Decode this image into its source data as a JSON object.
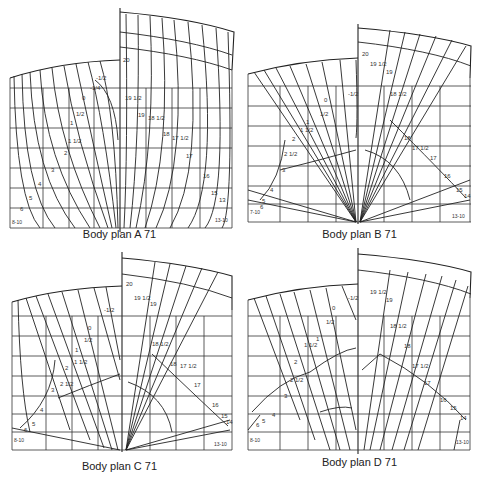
{
  "figure": {
    "panels": [
      {
        "id": "A",
        "caption": "Body plan A 71",
        "left_station_labels": [
          "-1/2",
          "-1/4",
          "0",
          "1/2",
          "1",
          "1 1/2",
          "2",
          "3",
          "4",
          "5",
          "6",
          "8-10"
        ],
        "right_station_labels": [
          "20",
          "19 1/2",
          "19",
          "18 1/2",
          "18",
          "17 1/2",
          "17",
          "16",
          "15",
          "13",
          "13-10"
        ]
      },
      {
        "id": "B",
        "caption": "Body plan B 71",
        "left_station_labels": [
          "-1/2",
          "0",
          "1/2",
          "1",
          "1 1/2",
          "2",
          "2 1/2",
          "3",
          "4",
          "5",
          "6",
          "7-10"
        ],
        "right_station_labels": [
          "20",
          "19 1/2",
          "19",
          "18 1/2",
          "18",
          "17 1/2",
          "17",
          "16",
          "15",
          "14",
          "13-10"
        ]
      },
      {
        "id": "C",
        "caption": "Body plan C 71",
        "left_station_labels": [
          "-1/2",
          "0",
          "1/2",
          "1",
          "1 1/2",
          "2",
          "2 1/2",
          "3",
          "4",
          "5",
          "6",
          "8-10"
        ],
        "right_station_labels": [
          "20",
          "19 1/2",
          "19",
          "18 1/2",
          "18",
          "17 1/2",
          "17",
          "16",
          "15",
          "14",
          "13-10"
        ]
      },
      {
        "id": "D",
        "caption": "Body plan D 71",
        "left_station_labels": [
          "-1/2",
          "0",
          "1/2",
          "1",
          "1 1/2",
          "2",
          "2 1/2",
          "3",
          "4",
          "5",
          "6",
          "8-10"
        ],
        "right_station_labels": [
          "19 1/2",
          "19",
          "18 1/2",
          "18",
          "17 1/2",
          "17",
          "16",
          "15",
          "14",
          "13-10"
        ]
      }
    ],
    "footer_fragment": "..."
  }
}
